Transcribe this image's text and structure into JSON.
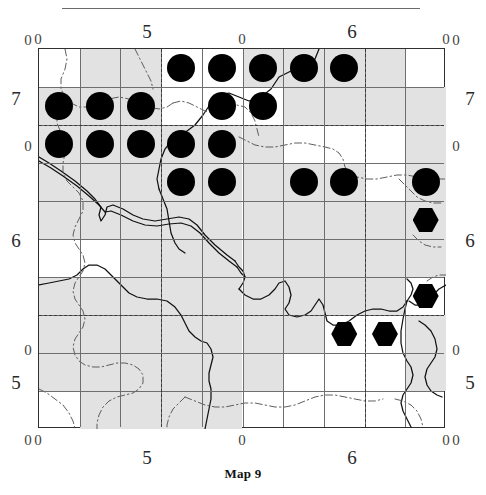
{
  "caption": "Map 9",
  "figure": {
    "type": "distribution-map",
    "grid": {
      "cols": 10,
      "rows": 10,
      "cell_px": 40.7,
      "cell_h_px": 38.0
    }
  },
  "axes": {
    "top": {
      "major": [
        {
          "label": "5",
          "x_px": 147
        },
        {
          "label": "6",
          "x_px": 352
        }
      ],
      "minor": [
        {
          "label": "0",
          "x_px": 38
        },
        {
          "label": "0",
          "x_px": 242
        },
        {
          "label": "0",
          "x_px": 446
        }
      ]
    },
    "bottom": {
      "major": [
        {
          "label": "5",
          "x_px": 147
        },
        {
          "label": "6",
          "x_px": 352
        }
      ],
      "minor": [
        {
          "label": "0",
          "x_px": 38
        },
        {
          "label": "0",
          "x_px": 242
        },
        {
          "label": "0",
          "x_px": 446
        }
      ]
    },
    "left": {
      "major": [
        {
          "label": "7",
          "y_px": 98
        },
        {
          "label": "6",
          "y_px": 240
        },
        {
          "label": "5",
          "y_px": 382
        }
      ],
      "minor": [
        {
          "label": "0",
          "y_px": 40
        },
        {
          "label": "0",
          "y_px": 146
        },
        {
          "label": "0",
          "y_px": 350
        },
        {
          "label": "0",
          "y_px": 440
        }
      ]
    },
    "right": {
      "major": [
        {
          "label": "7",
          "y_px": 98
        },
        {
          "label": "6",
          "y_px": 240
        },
        {
          "label": "5",
          "y_px": 382
        }
      ],
      "minor": [
        {
          "label": "0",
          "y_px": 40
        },
        {
          "label": "0",
          "y_px": 146
        },
        {
          "label": "0",
          "y_px": 350
        },
        {
          "label": "0",
          "y_px": 440
        }
      ]
    }
  },
  "chart_data": {
    "type": "scatter",
    "title": "Map 9",
    "xlabel": "",
    "ylabel": "",
    "grid": true,
    "legend": "none",
    "x_tick_labels": [
      "0",
      "5",
      "0",
      "6",
      "0"
    ],
    "y_tick_labels": [
      "0",
      "7",
      "0",
      "6",
      "0",
      "5",
      "0"
    ],
    "symbol_kinds": [
      {
        "name": "filled-circle",
        "meaning": "record",
        "color": "#000000"
      },
      {
        "name": "filled-hexagon",
        "meaning": "record-alt",
        "color": "#000000"
      }
    ],
    "records": [
      {
        "symbol": "dot",
        "col": 3,
        "row": 0
      },
      {
        "symbol": "dot",
        "col": 4,
        "row": 0
      },
      {
        "symbol": "dot",
        "col": 5,
        "row": 0
      },
      {
        "symbol": "dot",
        "col": 6,
        "row": 0
      },
      {
        "symbol": "dot",
        "col": 7,
        "row": 0
      },
      {
        "symbol": "dot",
        "col": 0,
        "row": 1
      },
      {
        "symbol": "dot",
        "col": 1,
        "row": 1
      },
      {
        "symbol": "dot",
        "col": 2,
        "row": 1
      },
      {
        "symbol": "dot",
        "col": 4,
        "row": 1
      },
      {
        "symbol": "dot",
        "col": 5,
        "row": 1
      },
      {
        "symbol": "dot",
        "col": 0,
        "row": 2
      },
      {
        "symbol": "dot",
        "col": 1,
        "row": 2
      },
      {
        "symbol": "dot",
        "col": 2,
        "row": 2
      },
      {
        "symbol": "dot",
        "col": 3,
        "row": 2
      },
      {
        "symbol": "dot",
        "col": 4,
        "row": 2
      },
      {
        "symbol": "dot",
        "col": 3,
        "row": 3
      },
      {
        "symbol": "dot",
        "col": 4,
        "row": 3
      },
      {
        "symbol": "dot",
        "col": 6,
        "row": 3
      },
      {
        "symbol": "dot",
        "col": 7,
        "row": 3
      },
      {
        "symbol": "dot",
        "col": 9,
        "row": 3
      },
      {
        "symbol": "hex",
        "col": 9,
        "row": 4
      },
      {
        "symbol": "hex",
        "col": 9,
        "row": 6
      },
      {
        "symbol": "hex",
        "col": 7,
        "row": 7
      },
      {
        "symbol": "hex",
        "col": 8,
        "row": 7
      }
    ],
    "shaded_cells": [
      [
        1,
        0
      ],
      [
        2,
        0
      ],
      [
        5,
        0
      ],
      [
        6,
        0
      ],
      [
        7,
        0
      ],
      [
        8,
        0
      ],
      [
        0,
        1
      ],
      [
        1,
        1
      ],
      [
        2,
        1
      ],
      [
        6,
        1
      ],
      [
        7,
        1
      ],
      [
        8,
        1
      ],
      [
        9,
        1
      ],
      [
        0,
        2
      ],
      [
        1,
        2
      ],
      [
        2,
        2
      ],
      [
        3,
        2
      ],
      [
        4,
        2
      ],
      [
        5,
        2
      ],
      [
        9,
        2
      ],
      [
        0,
        3
      ],
      [
        1,
        3
      ],
      [
        2,
        3
      ],
      [
        3,
        3
      ],
      [
        4,
        3
      ],
      [
        5,
        3
      ],
      [
        6,
        3
      ],
      [
        7,
        3
      ],
      [
        9,
        3
      ],
      [
        0,
        4
      ],
      [
        1,
        4
      ],
      [
        2,
        4
      ],
      [
        3,
        4
      ],
      [
        4,
        4
      ],
      [
        5,
        4
      ],
      [
        6,
        4
      ],
      [
        7,
        4
      ],
      [
        8,
        4
      ],
      [
        9,
        4
      ],
      [
        2,
        5
      ],
      [
        3,
        5
      ],
      [
        4,
        5
      ],
      [
        5,
        5
      ],
      [
        6,
        5
      ],
      [
        7,
        5
      ],
      [
        8,
        5
      ],
      [
        9,
        5
      ],
      [
        0,
        6
      ],
      [
        1,
        6
      ],
      [
        2,
        6
      ],
      [
        3,
        6
      ],
      [
        4,
        6
      ],
      [
        5,
        6
      ],
      [
        6,
        6
      ],
      [
        7,
        6
      ],
      [
        8,
        6
      ],
      [
        0,
        7
      ],
      [
        1,
        7
      ],
      [
        2,
        7
      ],
      [
        3,
        7
      ],
      [
        4,
        7
      ],
      [
        5,
        7
      ],
      [
        6,
        7
      ],
      [
        9,
        7
      ],
      [
        0,
        8
      ],
      [
        1,
        8
      ],
      [
        2,
        8
      ],
      [
        3,
        8
      ],
      [
        4,
        8
      ],
      [
        5,
        8
      ],
      [
        9,
        8
      ],
      [
        1,
        9
      ],
      [
        2,
        9
      ],
      [
        3,
        9
      ],
      [
        4,
        9
      ]
    ],
    "dashed_overlay": {
      "vertical_cols": [
        3,
        8
      ],
      "horizontal_rows": [
        2,
        7
      ]
    }
  }
}
